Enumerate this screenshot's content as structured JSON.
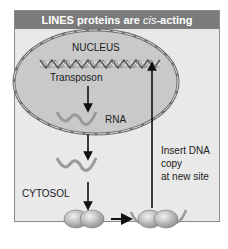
{
  "figure": {
    "title_prefix": "LINES proteins are ",
    "title_italic": "cis",
    "title_suffix": "-acting",
    "labels": {
      "nucleus": "NUCLEUS",
      "transposon": "Transposon",
      "rna": "RNA",
      "cytosol": "CYTOSOL",
      "insert_line1": "Insert DNA",
      "insert_line2": "copy",
      "insert_line3": "at new site"
    },
    "colors": {
      "title_bar": "#7b7b7b",
      "panel_bg": "#e9e9e9",
      "nucleus_fill": "#c9c9c9",
      "nucleus_border": "#6f6f6f",
      "arrow": "#111111",
      "rna": "#9a9a9a"
    },
    "flow": [
      "Transposon DNA in nucleus",
      "Transcribed to RNA",
      "RNA exported to cytosol",
      "Translated by ribosome; proteins bind own RNA",
      "Insert DNA copy at new site"
    ]
  }
}
